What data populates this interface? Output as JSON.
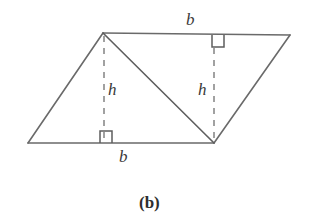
{
  "figure": {
    "caption": "(b)",
    "stroke_color": "#6a6a6a",
    "dash_color": "#7a7a7a",
    "background_color": "#ffffff",
    "text_color": "#3a3a3a"
  },
  "labels": {
    "base_top": "b",
    "base_bottom": "b",
    "height_left": "h",
    "height_right": "h"
  },
  "geometry": {
    "vertices": {
      "bottom_left": [
        28,
        143
      ],
      "top_left": [
        103,
        33
      ],
      "top_right": [
        290,
        35
      ],
      "bottom_right": [
        214,
        143
      ]
    },
    "diagonal": [
      [
        103,
        33
      ],
      [
        214,
        143
      ]
    ],
    "altitude_left": [
      [
        103,
        35
      ],
      [
        103,
        143
      ]
    ],
    "altitude_right": [
      [
        214,
        48
      ],
      [
        214,
        143
      ]
    ],
    "right_angle_markers": [
      {
        "name": "bottom-left-triangle",
        "x": 100,
        "y": 131,
        "size": 12
      },
      {
        "name": "top-right-triangle",
        "x": 212,
        "y": 35,
        "size": 12
      }
    ]
  }
}
